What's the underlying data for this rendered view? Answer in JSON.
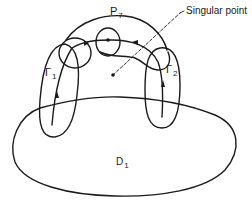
{
  "figure": {
    "labels": {
      "p7": {
        "base": "P",
        "sub": "7"
      },
      "singular_point": "Singular point",
      "gamma1": {
        "base": "Γ",
        "sub": "1"
      },
      "gamma2": {
        "base": "Γ",
        "sub": "2"
      },
      "d1": {
        "base": "D",
        "sub": "1"
      }
    },
    "colors": {
      "stroke": "#1a1a1a",
      "background": "#ffffff"
    }
  }
}
